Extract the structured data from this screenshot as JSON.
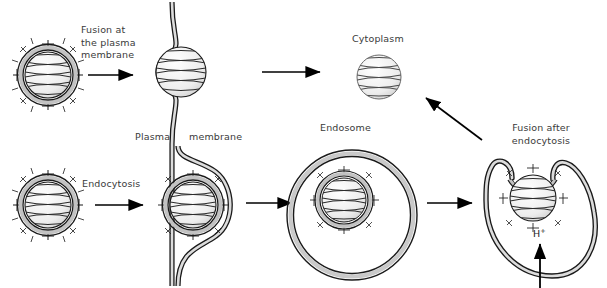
{
  "figure": {
    "background_color": "#ffffff",
    "text_color": "#3a3a3a",
    "membrane_fill": "#c9c9c9",
    "membrane_stroke": "#1a1a1a",
    "capsid_stroke": "#1a1a1a",
    "arrow_color": "#000000"
  },
  "labels": {
    "fusion_plasma_membrane": "Fusion at\nthe plasma\nmembrane",
    "endocytosis": "Endocytosis",
    "plasma": "Plasma",
    "membrane": "membrane",
    "cytoplasm": "Cytoplasm",
    "endosome": "Endosome",
    "fusion_after_endocytosis": "Fusion after\nendocytosis",
    "proton": "H",
    "proton_charge": "+"
  },
  "structures": {
    "enveloped_virus_top_left": {
      "name": "enveloped virion",
      "has_envelope": true,
      "has_spikes": true,
      "has_striped_nucleocapsid": true
    },
    "fusion_at_plasma_membrane": {
      "name": "nucleocapsid entering through curved plasma membrane",
      "has_envelope": false,
      "has_spikes": false,
      "has_striped_nucleocapsid": true
    },
    "free_nucleocapsid_cytoplasm": {
      "name": "free nucleocapsid in cytoplasm",
      "has_envelope": false,
      "has_spikes": false,
      "has_striped_nucleocapsid": true
    },
    "enveloped_virus_bottom_left": {
      "name": "enveloped virion before endocytosis",
      "has_envelope": true,
      "has_spikes": true,
      "has_striped_nucleocapsid": true
    },
    "endocytosis_engulfment": {
      "name": "plasma membrane engulfing enveloped virion",
      "has_envelope": true,
      "has_spikes": true
    },
    "endosome_with_virion": {
      "name": "endosome containing enveloped virion",
      "has_envelope": true,
      "has_spikes": true
    },
    "fusion_after_endocytosis_structure": {
      "name": "endosome membrane fused with viral envelope, acidified interior",
      "has_envelope": true,
      "has_spikes": true
    }
  },
  "arrows": [
    {
      "name": "arrow-fusion-plasma",
      "direction": "right"
    },
    {
      "name": "arrow-to-cytoplasm",
      "direction": "right"
    },
    {
      "name": "arrow-endocytosis",
      "direction": "right"
    },
    {
      "name": "arrow-to-endosome",
      "direction": "right"
    },
    {
      "name": "arrow-endosome-to-fusion",
      "direction": "right"
    },
    {
      "name": "arrow-release-to-cytoplasm",
      "direction": "up-left"
    },
    {
      "name": "arrow-proton-influx",
      "direction": "up"
    }
  ]
}
